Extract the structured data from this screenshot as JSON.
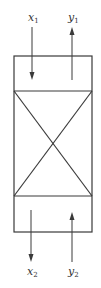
{
  "diagram": {
    "type": "heat-exchanger-block",
    "stroke_color": "#3a3a3a",
    "background": "#ffffff",
    "labels": {
      "x1": {
        "base": "x",
        "sub": "1"
      },
      "y1": {
        "base": "y",
        "sub": "1"
      },
      "x2": {
        "base": "x",
        "sub": "2"
      },
      "y2": {
        "base": "y",
        "sub": "2"
      }
    },
    "sections": [
      "top-section",
      "crossed-middle-section",
      "bottom-section"
    ],
    "arrows": [
      {
        "id": "x1",
        "direction": "down",
        "position": "top-left"
      },
      {
        "id": "y1",
        "direction": "up",
        "position": "top-right"
      },
      {
        "id": "x2",
        "direction": "down",
        "position": "bottom-left"
      },
      {
        "id": "y2",
        "direction": "up",
        "position": "bottom-right"
      }
    ]
  }
}
